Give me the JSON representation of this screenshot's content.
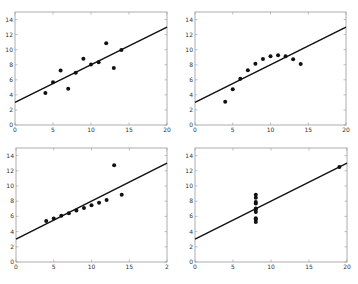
{
  "figure": {
    "background": "#ffffff",
    "axis_color": "#999999",
    "marker_color": "#111111",
    "line_color": "#111111"
  },
  "chart_data": [
    {
      "type": "scatter",
      "panel": "top-left",
      "title": "",
      "xlabel": "",
      "ylabel": "",
      "xlim": [
        0,
        20
      ],
      "ylim": [
        0,
        15
      ],
      "xticks": [
        "0",
        "5",
        "10",
        "15",
        "20"
      ],
      "yticks": [
        "0",
        "2",
        "4",
        "6",
        "8",
        "10",
        "12",
        "14"
      ],
      "grid": false,
      "x": [
        10,
        8,
        13,
        9,
        11,
        14,
        6,
        4,
        12,
        7,
        5
      ],
      "y": [
        8.04,
        6.95,
        7.58,
        8.81,
        8.33,
        9.96,
        7.24,
        4.26,
        10.84,
        4.82,
        5.68
      ],
      "fit_line": {
        "intercept": 3.0,
        "slope": 0.5,
        "x_range": [
          0,
          20
        ]
      },
      "box": {
        "left": 15,
        "top": 12,
        "right": 167,
        "bottom": 125
      }
    },
    {
      "type": "scatter",
      "panel": "top-right",
      "title": "",
      "xlabel": "",
      "ylabel": "",
      "xlim": [
        0,
        20
      ],
      "ylim": [
        0,
        15
      ],
      "xticks": [
        "0",
        "5",
        "10",
        "15",
        "20"
      ],
      "yticks": [
        "0",
        "2",
        "4",
        "6",
        "8",
        "10",
        "12",
        "14"
      ],
      "grid": false,
      "x": [
        10,
        8,
        13,
        9,
        11,
        14,
        6,
        4,
        12,
        7,
        5
      ],
      "y": [
        9.14,
        8.14,
        8.74,
        8.77,
        9.26,
        8.1,
        6.13,
        3.1,
        9.13,
        7.26,
        4.74
      ],
      "fit_line": {
        "intercept": 3.0,
        "slope": 0.5,
        "x_range": [
          0,
          20
        ]
      },
      "box": {
        "left": 195,
        "top": 12,
        "right": 346,
        "bottom": 125
      }
    },
    {
      "type": "scatter",
      "panel": "bottom-left",
      "title": "",
      "xlabel": "",
      "ylabel": "",
      "xlim": [
        0,
        20
      ],
      "ylim": [
        0,
        15
      ],
      "xticks": [
        "0",
        "5",
        "10",
        "15",
        "2"
      ],
      "yticks": [
        "0",
        "2",
        "4",
        "6",
        "8",
        "10",
        "12",
        "14"
      ],
      "grid": false,
      "x": [
        10,
        8,
        13,
        9,
        11,
        14,
        6,
        4,
        12,
        7,
        5
      ],
      "y": [
        7.46,
        6.77,
        12.74,
        7.11,
        7.81,
        8.84,
        6.08,
        5.39,
        8.15,
        6.42,
        5.73
      ],
      "fit_line": {
        "intercept": 3.0,
        "slope": 0.5,
        "x_range": [
          0,
          20
        ]
      },
      "box": {
        "left": 16,
        "top": 148,
        "right": 167,
        "bottom": 262
      }
    },
    {
      "type": "scatter",
      "panel": "bottom-right",
      "title": "",
      "xlabel": "",
      "ylabel": "",
      "xlim": [
        0,
        20
      ],
      "ylim": [
        0,
        15
      ],
      "xticks": [
        "0",
        "5",
        "10",
        "15",
        "20"
      ],
      "yticks": [
        "0",
        "2",
        "4",
        "6",
        "8",
        "10",
        "12",
        "14"
      ],
      "grid": false,
      "x": [
        8,
        8,
        8,
        8,
        8,
        8,
        8,
        19,
        8,
        8,
        8
      ],
      "y": [
        6.58,
        5.76,
        7.71,
        8.84,
        8.47,
        7.04,
        5.25,
        12.5,
        5.56,
        7.91,
        6.89
      ],
      "fit_line": {
        "intercept": 3.0,
        "slope": 0.5,
        "x_range": [
          0,
          20
        ]
      },
      "box": {
        "left": 195,
        "top": 148,
        "right": 347,
        "bottom": 262
      }
    }
  ]
}
